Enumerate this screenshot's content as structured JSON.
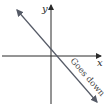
{
  "diagram": {
    "axes": {
      "x_label": "x",
      "y_label": "y"
    },
    "line": {
      "slope": "negative",
      "annotation": "Goes down"
    },
    "colors": {
      "axis": "#2a2a2a",
      "line": "#555a66",
      "background": "#ffffff"
    }
  }
}
